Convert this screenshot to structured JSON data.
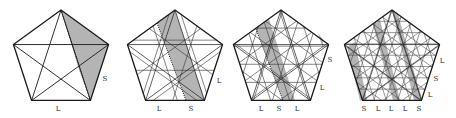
{
  "figure": {
    "colors": {
      "background": "#ffffff",
      "stroke": "#1a1a1a",
      "thin_stroke": "#333333",
      "shade": "#b4b4b4",
      "label": "#333333"
    },
    "radius": 50,
    "center_y": 60,
    "panels": [
      {
        "id": "panel-1",
        "center_x": 61,
        "levels": 1,
        "shaded_strip": [
          [
            61,
            10
          ],
          [
            108.6,
            44.5
          ],
          [
            90.4,
            100.5
          ],
          [
            79,
            70
          ]
        ],
        "dotted": [
          [
            61,
            10
          ],
          [
            90.4,
            100.5
          ]
        ],
        "labels": [
          {
            "text": "S",
            "x": 105,
            "y": 81
          },
          {
            "text": "L",
            "x": 58,
            "y": 111
          }
        ]
      },
      {
        "id": "panel-2",
        "center_x": 175,
        "levels": 2,
        "shaded_strip": [
          [
            157,
            23
          ],
          [
            175,
            10
          ],
          [
            205,
            100.5
          ],
          [
            186,
            100.5
          ]
        ],
        "dotted": [
          [
            157,
            23
          ],
          [
            186,
            100.5
          ]
        ],
        "labels": [
          {
            "text": "L",
            "x": 219,
            "y": 83
          },
          {
            "text": "L",
            "x": 159,
            "y": 111
          },
          {
            "text": "S",
            "x": 191,
            "y": 111
          }
        ]
      },
      {
        "id": "panel-3",
        "center_x": 281,
        "levels": 3,
        "shaded_strip": [
          [
            256,
            29
          ],
          [
            269,
            19
          ],
          [
            295,
            100.5
          ],
          [
            283,
            100.5
          ]
        ],
        "dotted": [
          [
            256,
            29
          ],
          [
            283,
            100.5
          ]
        ],
        "extra_shade": [
          [
            318,
            33
          ],
          [
            323,
            40
          ],
          [
            323,
            49
          ]
        ],
        "labels": [
          {
            "text": "S",
            "x": 330,
            "y": 62
          },
          {
            "text": "L",
            "x": 322,
            "y": 90
          },
          {
            "text": "L",
            "x": 261,
            "y": 111
          },
          {
            "text": "S",
            "x": 279,
            "y": 111
          },
          {
            "text": "L",
            "x": 297,
            "y": 111
          }
        ]
      },
      {
        "id": "panel-4",
        "center_x": 392,
        "levels": 4,
        "shaded_strips": [
          [
            [
              347,
              47
            ],
            [
              355,
              42
            ],
            [
              367,
              100.5
            ],
            [
              360,
              100.5
            ]
          ],
          [
            [
              373,
              25
            ],
            [
              380,
              20
            ],
            [
              400,
              100.5
            ],
            [
              393,
              100.5
            ]
          ],
          [
            [
              392,
              10
            ],
            [
              398,
              14
            ],
            [
              422,
              100.5
            ],
            [
              414,
              100.5
            ]
          ]
        ],
        "labels": [
          {
            "text": "L",
            "x": 442,
            "y": 63
          },
          {
            "text": "S",
            "x": 436,
            "y": 81
          },
          {
            "text": "L",
            "x": 430,
            "y": 97
          },
          {
            "text": "S",
            "x": 364,
            "y": 111
          },
          {
            "text": "L",
            "x": 378,
            "y": 111
          },
          {
            "text": "L",
            "x": 391,
            "y": 111
          },
          {
            "text": "L",
            "x": 405,
            "y": 111
          },
          {
            "text": "S",
            "x": 419,
            "y": 111
          }
        ]
      }
    ]
  }
}
